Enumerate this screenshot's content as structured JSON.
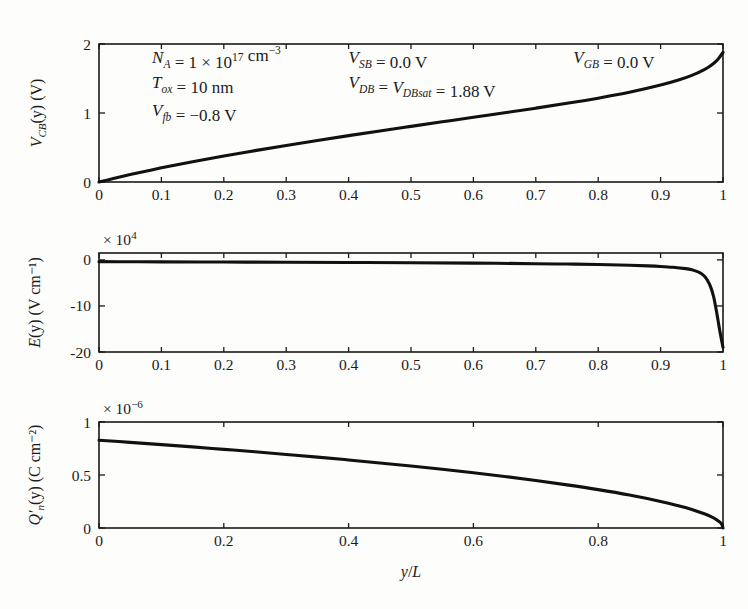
{
  "figure": {
    "xlabel": "y/L",
    "panels": [
      {
        "id": "vcb",
        "ylabel_main": "V",
        "ylabel_sub": "CB",
        "ylabel_tail": "(y) (V)",
        "yticks": [
          "0",
          "1",
          "2"
        ],
        "ytickvals": [
          0,
          1,
          2
        ],
        "ylim": [
          0,
          2
        ],
        "xticks": [
          "0",
          "0.1",
          "0.2",
          "0.3",
          "0.4",
          "0.5",
          "0.6",
          "0.7",
          "0.8",
          "0.9",
          "1"
        ],
        "xtickvals": [
          0,
          0.1,
          0.2,
          0.3,
          0.4,
          0.5,
          0.6,
          0.7,
          0.8,
          0.9,
          1
        ],
        "exponent": "",
        "annotations": [
          {
            "text": "N_A = 1 × 10^17 cm^-3",
            "x": 0.085,
            "y": 1.72
          },
          {
            "text": "T_ox = 10 nm",
            "x": 0.085,
            "y": 1.36
          },
          {
            "text": "V_fb = -0.8 V",
            "x": 0.085,
            "y": 0.95
          },
          {
            "text": "V_SB = 0.0 V",
            "x": 0.4,
            "y": 1.72
          },
          {
            "text": "V_DB = V_DBsat = 1.88 V",
            "x": 0.4,
            "y": 1.36
          },
          {
            "text": "V_GB = 0.0 V",
            "x": 0.76,
            "y": 1.72
          }
        ]
      },
      {
        "id": "efield",
        "ylabel_main": "E",
        "ylabel_sub": "",
        "ylabel_tail": "(y) (V cm⁻¹)",
        "yticks": [
          "0",
          "-10",
          "-20"
        ],
        "ytickvals": [
          0,
          -10,
          -20
        ],
        "ylim": [
          -20,
          1.5
        ],
        "xticks": [
          "0",
          "0.1",
          "0.2",
          "0.3",
          "0.4",
          "0.5",
          "0.6",
          "0.7",
          "0.8",
          "0.9",
          "1"
        ],
        "xtickvals": [
          0,
          0.1,
          0.2,
          0.3,
          0.4,
          0.5,
          0.6,
          0.7,
          0.8,
          0.9,
          1
        ],
        "exponent": "× 10",
        "exponent_sup": "4",
        "annotations": []
      },
      {
        "id": "qn",
        "ylabel_main": "Q′",
        "ylabel_sub": "n",
        "ylabel_tail": "(y) (C cm⁻²)",
        "yticks": [
          "0",
          "0.5",
          "1"
        ],
        "ytickvals": [
          0,
          0.5,
          1
        ],
        "ylim": [
          0,
          1
        ],
        "xticks": [
          "0",
          "0.2",
          "0.4",
          "0.6",
          "0.8",
          "1"
        ],
        "xtickvals": [
          0,
          0.2,
          0.4,
          0.6,
          0.8,
          1
        ],
        "exponent": "× 10",
        "exponent_sup": "−6",
        "annotations": []
      }
    ]
  },
  "chart_data": [
    {
      "type": "line",
      "title": "",
      "xlabel": "y/L",
      "ylabel": "V_CB(y) (V)",
      "xlim": [
        0,
        1
      ],
      "ylim": [
        0,
        2
      ],
      "grid": false,
      "legend": false,
      "series": [
        {
          "name": "V_CB(y)",
          "x": [
            0,
            0.02,
            0.05,
            0.1,
            0.15,
            0.2,
            0.25,
            0.3,
            0.35,
            0.4,
            0.45,
            0.5,
            0.55,
            0.6,
            0.65,
            0.7,
            0.75,
            0.8,
            0.85,
            0.9,
            0.93,
            0.95,
            0.97,
            0.98,
            0.99,
            0.995,
            1
          ],
          "y": [
            0,
            0.045,
            0.108,
            0.205,
            0.295,
            0.378,
            0.455,
            0.53,
            0.602,
            0.672,
            0.74,
            0.806,
            0.872,
            0.938,
            1.003,
            1.07,
            1.14,
            1.215,
            1.3,
            1.405,
            1.482,
            1.545,
            1.63,
            1.685,
            1.76,
            1.815,
            1.88
          ]
        }
      ]
    },
    {
      "type": "line",
      "title": "",
      "xlabel": "y/L",
      "ylabel": "E(y) (V cm^-1)",
      "y_multiplier": 10000,
      "xlim": [
        0,
        1
      ],
      "ylim": [
        -20,
        1.5
      ],
      "grid": false,
      "legend": false,
      "series": [
        {
          "name": "E(y)",
          "x": [
            0,
            0.05,
            0.1,
            0.2,
            0.3,
            0.4,
            0.5,
            0.6,
            0.7,
            0.75,
            0.8,
            0.85,
            0.88,
            0.9,
            0.92,
            0.94,
            0.95,
            0.96,
            0.965,
            0.97,
            0.975,
            0.98,
            0.985,
            0.99,
            0.995,
            1
          ],
          "y": [
            -0.38,
            -0.4,
            -0.42,
            -0.46,
            -0.5,
            -0.56,
            -0.62,
            -0.7,
            -0.82,
            -0.9,
            -1.0,
            -1.16,
            -1.3,
            -1.42,
            -1.6,
            -1.9,
            -2.15,
            -2.6,
            -2.95,
            -3.5,
            -4.4,
            -5.8,
            -8.0,
            -11.5,
            -15.5,
            -19.0
          ]
        }
      ]
    },
    {
      "type": "line",
      "title": "",
      "xlabel": "y/L",
      "ylabel": "Q'_n(y) (C cm^-2)",
      "y_multiplier": 1e-06,
      "xlim": [
        0,
        1
      ],
      "ylim": [
        0,
        1
      ],
      "grid": false,
      "legend": false,
      "series": [
        {
          "name": "Q'_n(y)",
          "x": [
            0,
            0.05,
            0.1,
            0.15,
            0.2,
            0.25,
            0.3,
            0.35,
            0.4,
            0.45,
            0.5,
            0.55,
            0.6,
            0.65,
            0.7,
            0.75,
            0.8,
            0.85,
            0.9,
            0.93,
            0.95,
            0.97,
            0.98,
            0.99,
            0.995,
            0.998,
            1
          ],
          "y": [
            0.828,
            0.808,
            0.787,
            0.765,
            0.742,
            0.719,
            0.694,
            0.669,
            0.642,
            0.614,
            0.585,
            0.554,
            0.521,
            0.486,
            0.448,
            0.407,
            0.362,
            0.311,
            0.251,
            0.208,
            0.175,
            0.134,
            0.109,
            0.077,
            0.055,
            0.035,
            0
          ]
        }
      ]
    }
  ]
}
